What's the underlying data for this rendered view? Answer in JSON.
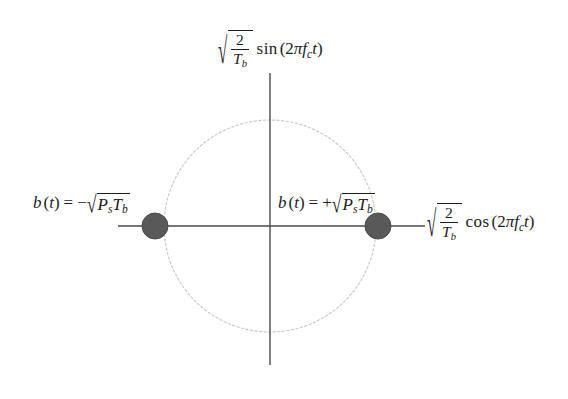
{
  "figure": {
    "name": "bpsk-signal-constellation",
    "type": "signal-constellation-diagram",
    "background_color": "#ffffff",
    "width": 568,
    "height": 399
  },
  "colors": {
    "axis": "#4a4a4a",
    "circle": "#c9c9c9",
    "point_fill": "#595959",
    "point_stroke": "#4a4a4a",
    "text": "#1c1c1c"
  },
  "axes": {
    "vertical": {
      "label_parts": {
        "radical_numerator": "2",
        "radical_denominator_base": "T",
        "radical_denominator_sub": "b",
        "function": "sin",
        "open_paren": "(",
        "coefficient": "2",
        "pi": "π",
        "freq_base": "f",
        "freq_sub": "c",
        "time": "t",
        "close_paren": ")"
      },
      "label_plain": "√(2/T_b) sin (2πf_c t)",
      "x": 270,
      "y_top": 73,
      "y_bottom": 365
    },
    "horizontal": {
      "label_parts": {
        "radical_numerator": "2",
        "radical_denominator_base": "T",
        "radical_denominator_sub": "b",
        "function": "cos",
        "open_paren": "(",
        "coefficient": "2",
        "pi": "π",
        "freq_base": "f",
        "freq_sub": "c",
        "time": "t",
        "close_paren": ")"
      },
      "label_plain": "√(2/T_b) cos (2πf_c t)",
      "y": 226,
      "x_left": 118,
      "x_right": 425
    }
  },
  "unit_circle": {
    "center_x": 270,
    "center_y": 226,
    "radius": 106,
    "stroke_style": "dotted"
  },
  "constellation_points": [
    {
      "id": "point-negative",
      "x": 155,
      "y": 226,
      "radius": 13,
      "label_parts": {
        "signal_base": "b",
        "open_paren": "(",
        "time": "t",
        "close_paren": ")",
        "equals": "=",
        "sign": "−",
        "power_base": "P",
        "power_sub": "s",
        "period_base": "T",
        "period_sub": "b"
      },
      "label_plain": "b(t) = −√(P_s T_b)"
    },
    {
      "id": "point-positive",
      "x": 378,
      "y": 226,
      "radius": 13,
      "label_parts": {
        "signal_base": "b",
        "open_paren": "(",
        "time": "t",
        "close_paren": ")",
        "equals": "=",
        "sign": "+",
        "power_base": "P",
        "power_sub": "s",
        "period_base": "T",
        "period_sub": "b"
      },
      "label_plain": "b(t) = +√(P_s T_b)"
    }
  ],
  "glyphs": {
    "surd": "√"
  },
  "chart_data": {
    "type": "scatter",
    "title": "",
    "xlabel": "√(2/T_b) cos (2πf_c t)",
    "ylabel": "√(2/T_b) sin (2πf_c t)",
    "xlim": [
      -1.45,
      1.45
    ],
    "ylim": [
      -1.45,
      1.45
    ],
    "grid": false,
    "legend": "none",
    "annotations": [
      "b(t) = −√(P_s T_b)",
      "b(t) = +√(P_s T_b)"
    ],
    "series": [
      {
        "name": "BPSK constellation points",
        "x": [
          -1,
          1
        ],
        "y": [
          0,
          0
        ],
        "labels": [
          "b(t) = −√(P_s T_b)",
          "b(t) = +√(P_s T_b)"
        ]
      },
      {
        "name": "unit circle",
        "radius": 1,
        "center": [
          0,
          0
        ],
        "style": "dotted"
      }
    ]
  }
}
